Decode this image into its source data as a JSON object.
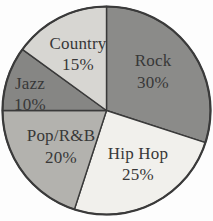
{
  "page": {
    "background": "#fdfdfd",
    "width": 213,
    "height": 221
  },
  "chart_data": {
    "type": "pie",
    "title": "",
    "direction": "clockwise",
    "start_angle_deg": 0,
    "legend": "none",
    "center": {
      "x": 106.5,
      "y": 110.5
    },
    "radius": 104,
    "outline_color": "#3a3a3a",
    "outline_width_outer": 2.2,
    "outline_width_inner": 1.4,
    "label_color": "#383838",
    "slices": [
      {
        "label": "Rock",
        "value_pct": 30,
        "color": "#8b8b89",
        "label_lines": [
          "Rock",
          "30%"
        ],
        "label_pos": {
          "x": 153,
          "y1": 66,
          "y2": 88
        }
      },
      {
        "label": "Hip Hop",
        "value_pct": 25,
        "color": "#f1f0ec",
        "label_lines": [
          "Hip Hop",
          "25%"
        ],
        "label_pos": {
          "x": 138,
          "y1": 159,
          "y2": 180
        }
      },
      {
        "label": "Pop/R&B",
        "value_pct": 20,
        "color": "#b3b2ae",
        "label_lines": [
          "Pop/R&B",
          "20%"
        ],
        "label_pos": {
          "x": 61,
          "y1": 141,
          "y2": 163
        }
      },
      {
        "label": "Jazz",
        "value_pct": 10,
        "color": "#868684",
        "label_lines": [
          "Jazz",
          "10%"
        ],
        "label_pos": {
          "x": 30,
          "y1": 89,
          "y2": 110
        }
      },
      {
        "label": "Country",
        "value_pct": 15,
        "color": "#d7d6d2",
        "label_lines": [
          "Country",
          "15%"
        ],
        "label_pos": {
          "x": 78,
          "y1": 49,
          "y2": 70
        }
      }
    ]
  }
}
